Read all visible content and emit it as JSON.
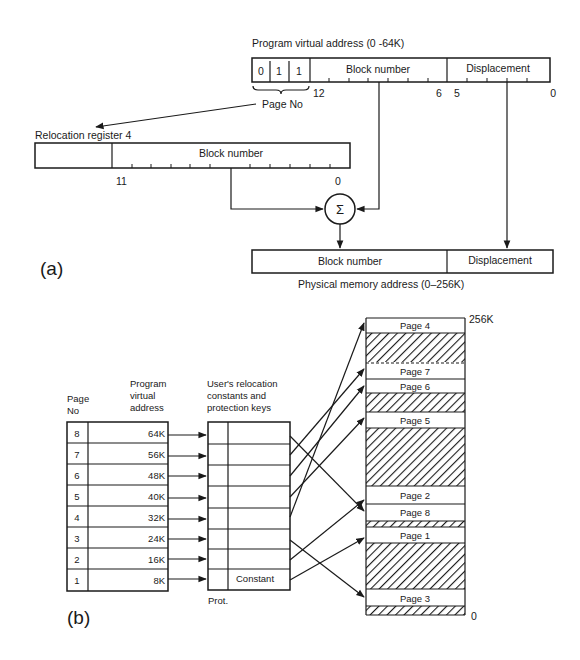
{
  "figure_a": {
    "label": "(a)",
    "virtual_address": {
      "title": "Program virtual address (0 -64K)",
      "page_bits": [
        "0",
        "1",
        "1"
      ],
      "block_field": "Block number",
      "displacement_field": "Displacement",
      "bit_labels": {
        "b12": "12",
        "b6": "6",
        "b5": "5",
        "b0": "0"
      },
      "page_no_label": "Page No"
    },
    "relocation_register": {
      "title": "Relocation register 4",
      "block_field": "Block number",
      "bit_labels": {
        "b11": "11",
        "b0": "0"
      }
    },
    "adder_symbol": "Σ",
    "physical_address": {
      "block_field": "Block number",
      "displacement_field": "Displacement",
      "title": "Physical memory address (0–256K)"
    }
  },
  "figure_b": {
    "label": "(b)",
    "headers": {
      "page_no": [
        "Page",
        "No"
      ],
      "virtual": [
        "Program",
        "virtual",
        "address"
      ],
      "relocation": [
        "User's relocation",
        "constants and",
        "protection keys"
      ]
    },
    "pages": [
      {
        "no": "8",
        "addr": "64K"
      },
      {
        "no": "7",
        "addr": "56K"
      },
      {
        "no": "6",
        "addr": "48K"
      },
      {
        "no": "5",
        "addr": "40K"
      },
      {
        "no": "4",
        "addr": "32K"
      },
      {
        "no": "3",
        "addr": "24K"
      },
      {
        "no": "2",
        "addr": "16K"
      },
      {
        "no": "1",
        "addr": "8K"
      }
    ],
    "constant_label": "Constant",
    "prot_label": "Prot.",
    "memory": {
      "top_label": "256K",
      "bottom_label": "0",
      "blocks": [
        {
          "label": "Page 4",
          "type": "page"
        },
        {
          "label": "",
          "type": "free"
        },
        {
          "label": "Page 7",
          "type": "page"
        },
        {
          "label": "Page 6",
          "type": "page"
        },
        {
          "label": "",
          "type": "free"
        },
        {
          "label": "Page 5",
          "type": "page"
        },
        {
          "label": "",
          "type": "free"
        },
        {
          "label": "Page 2",
          "type": "page"
        },
        {
          "label": "Page 8",
          "type": "page"
        },
        {
          "label": "",
          "type": "free"
        },
        {
          "label": "Page 1",
          "type": "page"
        },
        {
          "label": "",
          "type": "free"
        },
        {
          "label": "Page 3",
          "type": "page"
        },
        {
          "label": "",
          "type": "free"
        }
      ]
    }
  }
}
